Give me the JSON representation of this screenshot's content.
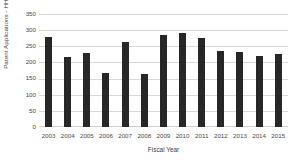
{
  "chart_data": {
    "type": "bar",
    "title": "",
    "xlabel": "Fiscal Year",
    "ylabel": "Patent Applications - HHS",
    "categories": [
      "2003",
      "2004",
      "2005",
      "2006",
      "2007",
      "2008",
      "2009",
      "2010",
      "2011",
      "2012",
      "2013",
      "2014",
      "2015"
    ],
    "values": [
      278,
      216,
      230,
      166,
      262,
      164,
      285,
      292,
      275,
      236,
      232,
      219,
      225
    ],
    "ylim": [
      0,
      350
    ],
    "ytick_labels": [
      "350",
      "300",
      "250",
      "200",
      "150",
      "100",
      "50",
      "0"
    ],
    "ytick_values": [
      350,
      300,
      250,
      200,
      150,
      100,
      50,
      0
    ],
    "grid": true,
    "legend": null,
    "bar_color": "#272727",
    "gridline_color": "#d9d9d9",
    "background_color": "#ffffff",
    "text_color": "#4a4a4a"
  }
}
